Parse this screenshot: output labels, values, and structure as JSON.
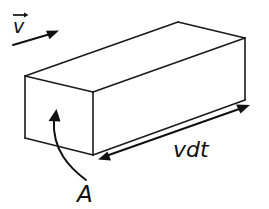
{
  "figure": {
    "type": "physics-diagram",
    "background_color": "#ffffff",
    "stroke_color": "#1a1a1a",
    "labels": {
      "velocity": "v",
      "velocity_vector_notation": "arrow-overbar",
      "length": "vdt",
      "area": "A"
    },
    "annotations": [
      {
        "name": "velocity-arrow",
        "kind": "single-headed-arrow",
        "from": [
          14,
          44
        ],
        "to": [
          58,
          31
        ],
        "label": "v"
      },
      {
        "name": "length-arrow",
        "kind": "double-headed-arrow",
        "from": [
          99,
          159
        ],
        "to": [
          249,
          106
        ],
        "label": "vdt"
      },
      {
        "name": "area-pointer",
        "kind": "curved-arrow",
        "from": [
          86,
          178
        ],
        "to": [
          56,
          110
        ],
        "label": "A"
      }
    ],
    "solid": {
      "name": "rectangular-prism",
      "vertices": {
        "front_top_left": [
          25,
          76
        ],
        "front_top_right": [
          93,
          92
        ],
        "front_bottom_left": [
          25,
          138
        ],
        "front_bottom_right": [
          93,
          155
        ],
        "back_top_left": [
          178,
          22
        ],
        "back_top_right": [
          245,
          38
        ],
        "back_bottom_right": [
          245,
          100
        ]
      }
    }
  }
}
